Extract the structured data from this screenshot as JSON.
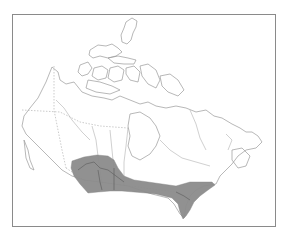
{
  "map": {
    "subject": "Canada",
    "type": "species range map",
    "frame": {
      "x": 12,
      "y": 14,
      "width": 264,
      "height": 213,
      "border_color": "#8a8a8a"
    },
    "colors": {
      "background": "#ffffff",
      "coastline": "#9a9a9a",
      "range_fill": "#8c8c8c"
    },
    "shaded_range": {
      "description": "Southern Canada band from Alberta across the prairies to southern Ontario and Quebec",
      "approx_regions": [
        "Alberta",
        "Saskatchewan",
        "Manitoba",
        "Ontario",
        "Quebec"
      ]
    }
  }
}
